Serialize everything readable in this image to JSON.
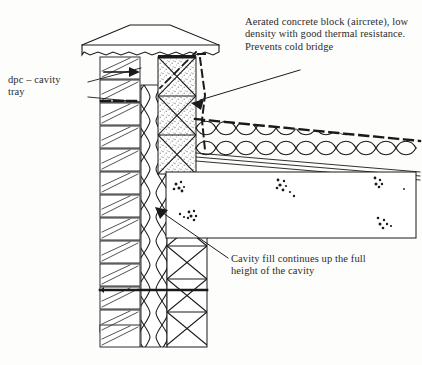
{
  "diagram": {
    "background_color": "#fdfdfb",
    "ink_color": "#1a1a1a",
    "annotations": [
      {
        "id": "aircrete",
        "text": "Aerated concrete block (aircrete), low\ndensity with good thermal resistance.\nPrevents cold bridge",
        "leader": "line-to-aircrete-block"
      },
      {
        "id": "dpc",
        "text": "dpc – cavity\ntray",
        "leader": "line-to-dpc-tray"
      },
      {
        "id": "cavity_fill",
        "text": "Cavity fill continues up the full\nheight of the cavity",
        "leader": "line-to-cavity-insulation"
      }
    ],
    "components": [
      {
        "name": "coping-stone",
        "hatch": "none"
      },
      {
        "name": "brick-outer-leaf",
        "hatch": "diagonal-bricks"
      },
      {
        "name": "cavity-insulation",
        "hatch": "wavy-lens"
      },
      {
        "name": "blockwork-inner-leaf",
        "hatch": "cross-x"
      },
      {
        "name": "aircrete-block",
        "hatch": "stipple-cross"
      },
      {
        "name": "roof-insulation",
        "hatch": "cloud-quilt"
      },
      {
        "name": "concrete-slab",
        "hatch": "aggregate-dots"
      },
      {
        "name": "dpc-cavity-tray",
        "hatch": "solid-thick"
      },
      {
        "name": "roof-membrane-dashed",
        "hatch": "dashed"
      }
    ]
  }
}
